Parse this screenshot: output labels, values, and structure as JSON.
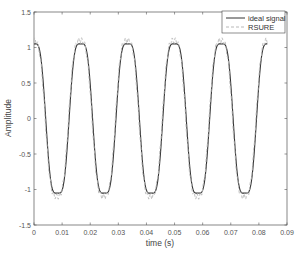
{
  "chart_data": {
    "type": "line",
    "title": "",
    "xlabel": "time (s)",
    "ylabel": "Amplitude",
    "xlim": [
      0,
      0.09
    ],
    "ylim": [
      -1.5,
      1.5
    ],
    "xticks": [
      "0",
      "0.01",
      "0.02",
      "0.03",
      "0.04",
      "0.05",
      "0.06",
      "0.07",
      "0.08",
      "0.09"
    ],
    "yticks": [
      "-1.5",
      "-1",
      "-0.5",
      "0",
      "0.5",
      "1",
      "1.5"
    ],
    "grid": false,
    "legend_position": "upper right",
    "legend": [
      "ideal signal",
      "RSURE"
    ],
    "series": [
      {
        "name": "ideal signal",
        "style": "solid",
        "color": "#333333",
        "frequency_hz": 60,
        "amplitude": 1.05,
        "x_range": [
          0,
          0.083
        ],
        "x": [
          0,
          0.0083,
          0.0167,
          0.025,
          0.0333,
          0.0417,
          0.05,
          0.0583,
          0.0667,
          0.075,
          0.083
        ],
        "values": [
          1.05,
          -1.05,
          1.05,
          -1.05,
          1.05,
          -1.05,
          1.05,
          -1.05,
          1.05,
          -1.05,
          1.05
        ]
      },
      {
        "name": "RSURE",
        "style": "dashed",
        "color": "#b8b8b8",
        "frequency_hz": 60,
        "amplitude": 1.1,
        "x_range": [
          0,
          0.083
        ],
        "x": [
          0,
          0.0083,
          0.0167,
          0.025,
          0.0333,
          0.0417,
          0.05,
          0.0583,
          0.0667,
          0.075,
          0.083
        ],
        "values": [
          1.1,
          -1.1,
          1.15,
          -1.08,
          1.1,
          -1.08,
          1.12,
          -1.15,
          1.1,
          -1.1,
          1.05
        ]
      }
    ]
  }
}
